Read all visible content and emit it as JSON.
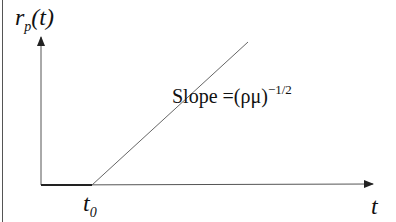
{
  "diagram": {
    "y_axis_label": {
      "base": "r",
      "subscript": "p",
      "rest": "(t)"
    },
    "x_axis_label": "t",
    "origin_marker": {
      "base": "t",
      "subscript": "0"
    },
    "slope_label": {
      "prefix": "Slope =",
      "expr": "(ρμ)",
      "exponent": "−1/2"
    },
    "colors": {
      "axis": "#222222",
      "line": "#666666",
      "text": "#111111"
    }
  }
}
